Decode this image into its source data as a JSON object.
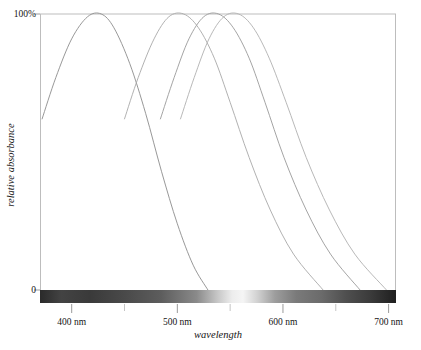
{
  "chart_data": {
    "type": "line",
    "title": "",
    "xlabel": "wavelength",
    "ylabel": "relative absorbance",
    "xlim": [
      370,
      707
    ],
    "ylim": [
      0,
      100
    ],
    "grid": false,
    "legend": null,
    "x_unit": "nm",
    "y_top_label": "100%",
    "y_bottom_label": "0",
    "x_tick_labels": [
      "400 nm",
      "500 nm",
      "600 nm",
      "700 nm"
    ],
    "x_tick_values": [
      400,
      500,
      600,
      700
    ],
    "x_minor_tick_values": [
      450,
      550,
      650
    ],
    "series": [
      {
        "name": "curve-1",
        "peak_wavelength": 428,
        "peak_value": 100,
        "start_wavelength": 372,
        "start_value": 62,
        "end_wavelength": 529,
        "end_value": 0,
        "color": "#8c8c8c",
        "x": [
          372,
          385,
          400,
          415,
          428,
          440,
          455,
          470,
          485,
          500,
          515,
          529
        ],
        "y": [
          62,
          77,
          91,
          99,
          100,
          95,
          82,
          64,
          43,
          24,
          9,
          0
        ]
      },
      {
        "name": "curve-2",
        "peak_wavelength": 506,
        "peak_value": 100,
        "start_wavelength": 450,
        "start_value": 62,
        "end_wavelength": 638,
        "end_value": 0,
        "color": "#a8a8a8",
        "x": [
          450,
          463,
          478,
          492,
          506,
          520,
          535,
          550,
          568,
          588,
          610,
          638
        ],
        "y": [
          62,
          77,
          91,
          99,
          100,
          95,
          84,
          68,
          48,
          29,
          13,
          0
        ]
      },
      {
        "name": "curve-3",
        "peak_wavelength": 539,
        "peak_value": 100,
        "start_wavelength": 484,
        "start_value": 62,
        "end_wavelength": 673,
        "end_value": 0,
        "color": "#9a9a9a",
        "x": [
          484,
          497,
          511,
          525,
          539,
          553,
          568,
          583,
          601,
          622,
          645,
          673
        ],
        "y": [
          62,
          77,
          91,
          99,
          100,
          95,
          84,
          68,
          48,
          29,
          13,
          0
        ]
      },
      {
        "name": "curve-4",
        "peak_wavelength": 558,
        "peak_value": 100,
        "start_wavelength": 503,
        "start_value": 62,
        "end_wavelength": 698,
        "end_value": 0,
        "color": "#b0b0b0",
        "x": [
          503,
          516,
          530,
          544,
          558,
          572,
          587,
          603,
          622,
          644,
          668,
          698
        ],
        "y": [
          62,
          77,
          91,
          99,
          100,
          95,
          84,
          68,
          48,
          29,
          13,
          0
        ]
      }
    ],
    "spectrum_bar": {
      "name": "visible-spectrum-bar",
      "from_wavelength": 370,
      "to_wavelength": 707,
      "stops": [
        {
          "pos": 0,
          "color": "#2a2a2a"
        },
        {
          "pos": 6,
          "color": "#434343"
        },
        {
          "pos": 14,
          "color": "#3a3a3a"
        },
        {
          "pos": 24,
          "color": "#4a4a4a"
        },
        {
          "pos": 34,
          "color": "#5d5d5d"
        },
        {
          "pos": 44,
          "color": "#8a8a8a"
        },
        {
          "pos": 50,
          "color": "#c8c8c8"
        },
        {
          "pos": 54,
          "color": "#ededed"
        },
        {
          "pos": 57,
          "color": "#f5f5f5"
        },
        {
          "pos": 61,
          "color": "#d2d2d2"
        },
        {
          "pos": 66,
          "color": "#9d9d9d"
        },
        {
          "pos": 72,
          "color": "#7a7a7a"
        },
        {
          "pos": 79,
          "color": "#6b6b6b"
        },
        {
          "pos": 86,
          "color": "#4f4f4f"
        },
        {
          "pos": 93,
          "color": "#3a3a3a"
        },
        {
          "pos": 100,
          "color": "#1f1f1f"
        }
      ]
    },
    "axes_color": "#9b9b9b",
    "frame": {
      "left_px": 40,
      "right_px": 396,
      "top_px": 14,
      "bottom_px": 290
    }
  }
}
